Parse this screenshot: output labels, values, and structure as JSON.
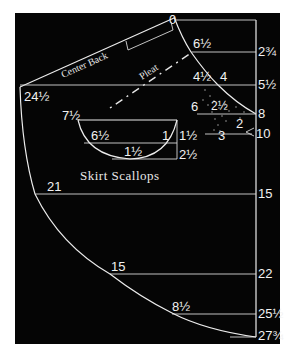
{
  "diagram": {
    "background_color": "#050505",
    "line_color": "#ececec",
    "labels": {
      "center_back": "Center Back",
      "pleat": "Pleat",
      "skirt_scallops": "Skirt Scallops"
    },
    "right_measurements": {
      "top": "0",
      "m1": "2¾",
      "m2": "5½",
      "m3": "8",
      "m4": "10",
      "m5": "15",
      "m6": "22",
      "m7": "25½",
      "m8": "27¾"
    },
    "curve_points": {
      "p0": "6½",
      "p1": "4½",
      "p2": "4",
      "p3": "24½",
      "p4": "21",
      "p5": "15",
      "p6": "8½"
    },
    "dart_labels": {
      "a": "6",
      "b": "2½",
      "c": "2",
      "d": "3"
    },
    "scallop_labels": {
      "width": "7½",
      "upper": "6½",
      "right_small": "1",
      "depth1": "1½",
      "bottom": "1½",
      "depth2": "2½"
    }
  }
}
